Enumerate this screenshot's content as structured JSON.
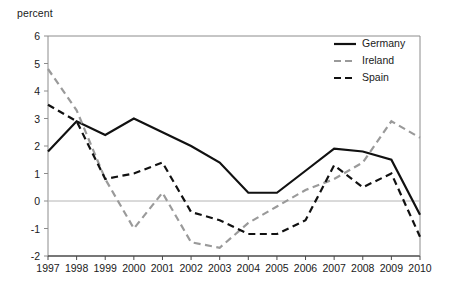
{
  "chart_data": {
    "type": "line",
    "title": "",
    "subtitle": "",
    "xlabel": "",
    "ylabel": "percent",
    "x": [
      1997,
      1998,
      1999,
      2000,
      2001,
      2002,
      2003,
      2004,
      2005,
      2006,
      2007,
      2008,
      2009,
      2010
    ],
    "xtick_labels": [
      "1997",
      "1998",
      "1999",
      "2000",
      "2001",
      "2002",
      "2003",
      "2004",
      "2005",
      "2006",
      "2007",
      "2008",
      "2009",
      "2010"
    ],
    "ytick_labels": [
      "6",
      "5",
      "4",
      "3",
      "2",
      "1",
      "0",
      "-1",
      "-2"
    ],
    "yticks": [
      6,
      5,
      4,
      3,
      2,
      1,
      0,
      -1,
      -2
    ],
    "ylim": [
      -2,
      6
    ],
    "xlim": [
      1997,
      2010
    ],
    "grid": false,
    "zero_line": true,
    "legend_position": "top-right",
    "series": [
      {
        "name": "Germany",
        "color": "#111111",
        "style": "solid",
        "values": [
          1.8,
          2.9,
          2.4,
          3.0,
          2.5,
          2.0,
          1.4,
          0.3,
          0.3,
          1.1,
          1.9,
          1.8,
          1.5,
          -0.5
        ]
      },
      {
        "name": "Ireland",
        "color": "#9a9a9a",
        "style": "dashed",
        "values": [
          4.8,
          3.3,
          0.8,
          -1.0,
          0.3,
          -1.5,
          -1.7,
          -0.8,
          -0.2,
          0.4,
          0.8,
          1.4,
          2.9,
          2.3
        ]
      },
      {
        "name": "Spain",
        "color": "#111111",
        "style": "dashed",
        "values": [
          3.5,
          2.9,
          0.8,
          1.0,
          1.4,
          -0.4,
          -0.7,
          -1.2,
          -1.2,
          -0.7,
          1.3,
          0.5,
          1.0,
          -1.3
        ]
      }
    ]
  },
  "legend": {
    "items": [
      {
        "label": "Germany"
      },
      {
        "label": "Ireland"
      },
      {
        "label": "Spain"
      }
    ]
  }
}
